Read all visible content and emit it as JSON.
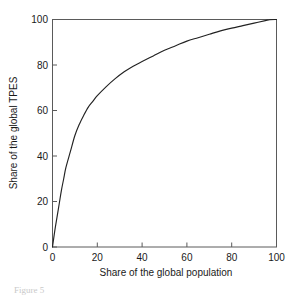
{
  "figure": {
    "caption": "Figure 5",
    "caption_visible": "partially cut off at bottom edge"
  },
  "chart_data": {
    "type": "line",
    "title": "",
    "subtitle": "",
    "xlabel": "Share of the global population",
    "ylabel": "Share of the global TPES",
    "xlim": [
      0,
      100
    ],
    "ylim": [
      0,
      100
    ],
    "xticks": [
      0,
      20,
      40,
      60,
      80,
      100
    ],
    "yticks": [
      0,
      20,
      40,
      60,
      80,
      100
    ],
    "xtick_labels": [
      "0",
      "20",
      "40",
      "60",
      "80",
      "100"
    ],
    "ytick_labels": [
      "0",
      "20",
      "40",
      "60",
      "80",
      "100"
    ],
    "grid": false,
    "legend": false,
    "legend_position": "none",
    "annotations": [],
    "series": [
      {
        "name": "Cumulative share of global TPES",
        "color": "#222222",
        "x": [
          0,
          1,
          2,
          3,
          4,
          5,
          6,
          8,
          10,
          12,
          14,
          16,
          18,
          20,
          24,
          28,
          32,
          36,
          40,
          45,
          50,
          55,
          60,
          65,
          70,
          75,
          80,
          85,
          90,
          95,
          97,
          100
        ],
        "y": [
          0,
          7,
          13,
          19,
          25,
          30,
          35,
          42,
          49,
          54,
          58,
          61.5,
          64,
          66.5,
          70.5,
          74,
          77,
          79.5,
          81.5,
          84,
          86.5,
          88.5,
          90.5,
          92,
          93.5,
          95,
          96.2,
          97.3,
          98.4,
          99.5,
          99.9,
          100
        ]
      }
    ]
  },
  "axes": {
    "x_title": "Share of the global population",
    "y_title": "Share of the global TPES"
  }
}
